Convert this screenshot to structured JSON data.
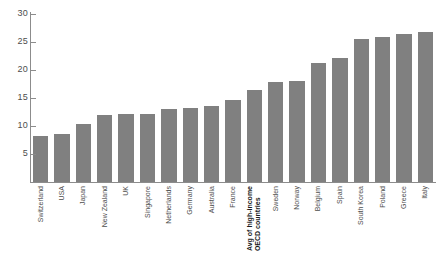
{
  "chart_data": {
    "type": "bar",
    "title": "",
    "xlabel": "",
    "ylabel": "",
    "ylim": [
      0,
      30
    ],
    "yticks": [
      5,
      10,
      15,
      20,
      25,
      30
    ],
    "grid": false,
    "legend": null,
    "bar_color": "#808080",
    "highlight_category": "Avg of high-income OECD countries",
    "categories": [
      "Switzerland",
      "USA",
      "Japan",
      "New Zealand",
      "UK",
      "Singapore",
      "Netherlands",
      "Germany",
      "Australia",
      "France",
      "Avg of high-income OECD countries",
      "Sweden",
      "Norway",
      "Belgium",
      "Spain",
      "South Korea",
      "Poland",
      "Greece",
      "Italy"
    ],
    "values": [
      8.2,
      8.5,
      10.3,
      12.0,
      12.2,
      12.2,
      13.0,
      13.3,
      13.5,
      14.7,
      16.5,
      17.8,
      18.0,
      21.2,
      22.1,
      25.5,
      25.9,
      26.4,
      26.7
    ]
  },
  "axis": {
    "y_tick_labels": [
      "30",
      "25",
      "20",
      "15",
      "10",
      "5"
    ]
  },
  "x_labels": [
    {
      "line1": "Switzerland",
      "line2": "",
      "bold": false
    },
    {
      "line1": "USA",
      "line2": "",
      "bold": false
    },
    {
      "line1": "Japan",
      "line2": "",
      "bold": false
    },
    {
      "line1": "New Zealand",
      "line2": "",
      "bold": false
    },
    {
      "line1": "UK",
      "line2": "",
      "bold": false
    },
    {
      "line1": "Singapore",
      "line2": "",
      "bold": false
    },
    {
      "line1": "Netherlands",
      "line2": "",
      "bold": false
    },
    {
      "line1": "Germany",
      "line2": "",
      "bold": false
    },
    {
      "line1": "Australia",
      "line2": "",
      "bold": false
    },
    {
      "line1": "France",
      "line2": "",
      "bold": false
    },
    {
      "line1": "Avg of high-income",
      "line2": "OECD countries",
      "bold": true
    },
    {
      "line1": "Sweden",
      "line2": "",
      "bold": false
    },
    {
      "line1": "Norway",
      "line2": "",
      "bold": false
    },
    {
      "line1": "Belgium",
      "line2": "",
      "bold": false
    },
    {
      "line1": "Spain",
      "line2": "",
      "bold": false
    },
    {
      "line1": "South Korea",
      "line2": "",
      "bold": false
    },
    {
      "line1": "Poland",
      "line2": "",
      "bold": false
    },
    {
      "line1": "Greece",
      "line2": "",
      "bold": false
    },
    {
      "line1": "Italy",
      "line2": "",
      "bold": false
    }
  ]
}
